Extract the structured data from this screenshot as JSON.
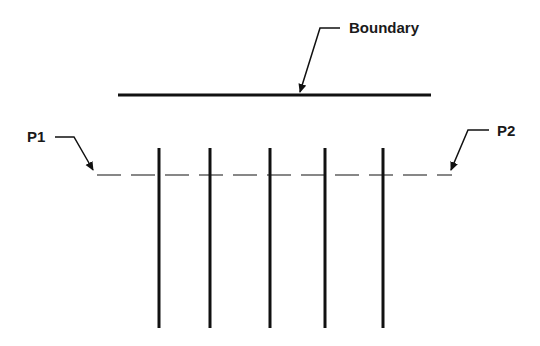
{
  "labels": {
    "boundary": "Boundary",
    "p1": "P1",
    "p2": "P2"
  },
  "diagram": {
    "boundary_line": {
      "x1": 118,
      "x2": 431,
      "y": 95
    },
    "dashed_line": {
      "x1": 97,
      "x2": 452,
      "y": 175
    },
    "vertical_lines_x": [
      159,
      210,
      270,
      325,
      383
    ],
    "vertical_lines_y": [
      148,
      328
    ],
    "colors": {
      "line": "#111111",
      "background": "#ffffff"
    }
  }
}
